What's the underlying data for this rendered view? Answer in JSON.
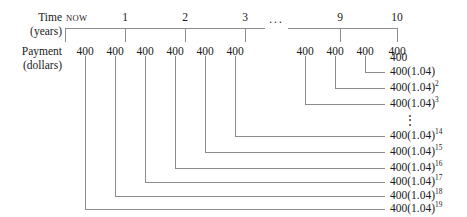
{
  "figure": {
    "kind": "cash-flow-timeline",
    "axis_caption_time": {
      "line1": "Time",
      "line2": "(years)"
    },
    "axis_caption_payment": {
      "line1": "Payment",
      "line2": "(dollars)"
    },
    "axis_ellipsis": "···",
    "vertical_ellipsis": "⋮",
    "stroke_color": "#8c8c8c",
    "text_color": "#1a1a1a"
  },
  "timeline": {
    "ticks": [
      {
        "label": "NOW",
        "x": 65,
        "is_now": true
      },
      {
        "label": "1",
        "x": 125,
        "is_now": false
      },
      {
        "label": "2",
        "x": 185,
        "is_now": false
      },
      {
        "label": "3",
        "x": 245,
        "is_now": false
      },
      {
        "label": "9",
        "x": 340,
        "is_now": false
      },
      {
        "label": "10",
        "x": 397,
        "is_now": false
      }
    ],
    "segments": [
      {
        "x1": 65,
        "x2": 265
      },
      {
        "x1": 288,
        "x2": 397
      }
    ],
    "axis_y": 28,
    "tick_drop": 14
  },
  "payments": {
    "amount": "400",
    "y": 46,
    "entries": [
      {
        "x": 85,
        "amount": "400"
      },
      {
        "x": 115,
        "amount": "400"
      },
      {
        "x": 145,
        "amount": "400"
      },
      {
        "x": 175,
        "amount": "400"
      },
      {
        "x": 205,
        "amount": "400"
      },
      {
        "x": 235,
        "amount": "400"
      },
      {
        "x": 305,
        "amount": "400"
      },
      {
        "x": 335,
        "amount": "400"
      },
      {
        "x": 365,
        "amount": "400"
      },
      {
        "x": 397,
        "amount": "400"
      }
    ]
  },
  "values": [
    {
      "base": "400",
      "exp": "",
      "y": 58,
      "x": 397,
      "connector": false
    },
    {
      "base": "400(1.04)",
      "exp": "",
      "y": 72,
      "x": 365,
      "connector": true
    },
    {
      "base": "400(1.04)",
      "exp": "2",
      "y": 88,
      "x": 335,
      "connector": true
    },
    {
      "base": "400(1.04)",
      "exp": "3",
      "y": 104,
      "x": 305,
      "connector": true
    },
    {
      "base": "400(1.04)",
      "exp": "14",
      "y": 136,
      "x": 235,
      "connector": true
    },
    {
      "base": "400(1.04)",
      "exp": "15",
      "y": 152,
      "x": 205,
      "connector": true
    },
    {
      "base": "400(1.04)",
      "exp": "16",
      "y": 168,
      "x": 175,
      "connector": true
    },
    {
      "base": "400(1.04)",
      "exp": "17",
      "y": 182,
      "x": 145,
      "connector": true
    },
    {
      "base": "400(1.04)",
      "exp": "18",
      "y": 196,
      "x": 115,
      "connector": true
    },
    {
      "base": "400(1.04)",
      "exp": "19",
      "y": 209,
      "x": 85,
      "connector": true
    }
  ],
  "value_gap_dots_y": 120,
  "connector": {
    "top_y": 56,
    "right_x": 385
  }
}
